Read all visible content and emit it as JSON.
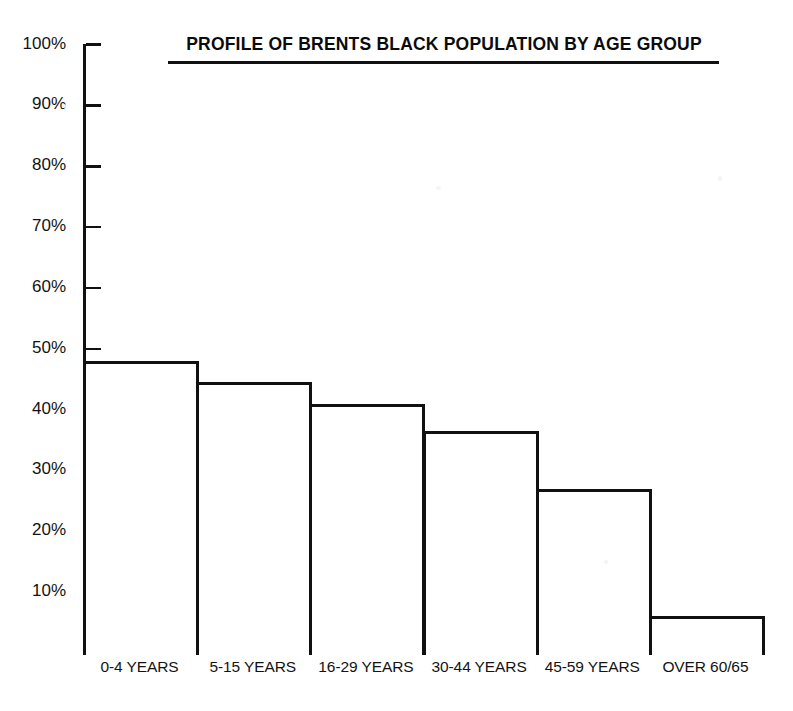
{
  "chart_data": {
    "type": "bar",
    "title": "PROFILE OF BRENTS BLACK POPULATION BY AGE GROUP",
    "xlabel": "",
    "ylabel": "",
    "categories": [
      "0-4 YEARS",
      "5-15 YEARS",
      "16-29 YEARS",
      "30-44 YEARS",
      "45-59 YEARS",
      "OVER 60/65"
    ],
    "values": [
      48,
      44.5,
      41,
      36.5,
      27,
      6
    ],
    "ylim": [
      0,
      100
    ],
    "yticks": [
      10,
      20,
      30,
      40,
      50,
      60,
      70,
      80,
      90,
      100
    ],
    "ytick_labels": [
      "10%",
      "20%",
      "30%",
      "40%",
      "50%",
      "60%",
      "70%",
      "80%",
      "90%",
      "100%"
    ],
    "grid": false,
    "legend": null,
    "bar_style": {
      "fill": "#ffffff",
      "outline": "#111111"
    }
  },
  "axis": {
    "line_color": "#111111"
  },
  "colors": {
    "background": "#ffffff",
    "ink": "#111111"
  }
}
